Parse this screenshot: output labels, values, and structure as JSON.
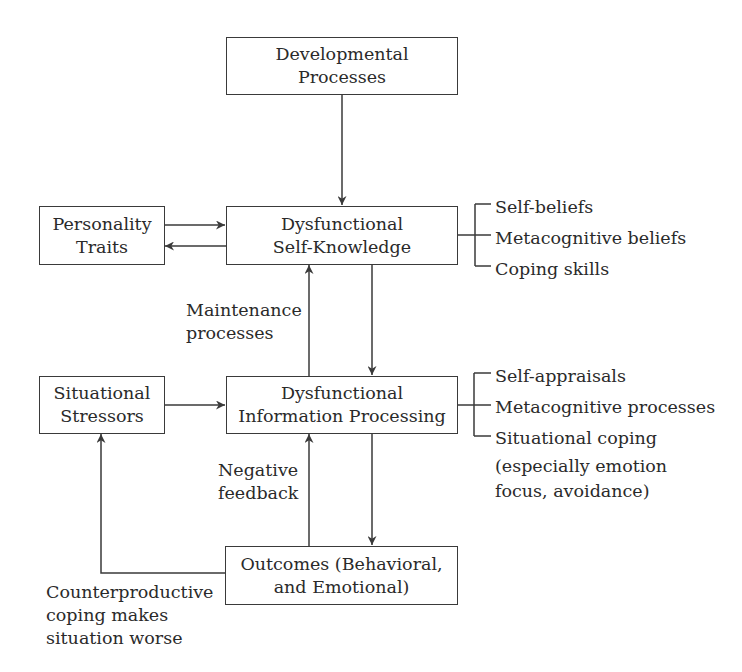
{
  "diagram": {
    "boxes": {
      "developmental": {
        "lines": [
          "Developmental",
          "Processes"
        ]
      },
      "personality": {
        "lines": [
          "Personality",
          "Traits"
        ]
      },
      "self_knowledge": {
        "lines": [
          "Dysfunctional",
          "Self-Knowledge"
        ]
      },
      "stressors": {
        "lines": [
          "Situational",
          "Stressors"
        ]
      },
      "info_processing": {
        "lines": [
          "Dysfunctional",
          "Information Processing"
        ]
      },
      "outcomes": {
        "lines": [
          "Outcomes (Behavioral,",
          "and Emotional)"
        ]
      }
    },
    "edge_labels": {
      "maintenance": {
        "lines": [
          "Maintenance",
          "processes"
        ]
      },
      "negative_feedback": {
        "lines": [
          "Negative",
          "feedback"
        ]
      },
      "counterproductive": {
        "lines": [
          "Counterproductive",
          "coping makes",
          "situation worse"
        ]
      }
    },
    "lists": {
      "self_knowledge_components": [
        "Self-beliefs",
        "Metacognitive beliefs",
        "Coping skills"
      ],
      "info_processing_components": [
        "Self-appraisals",
        "Metacognitive processes",
        "Situational coping",
        "(especially emotion",
        "focus, avoidance)"
      ]
    },
    "colors": {
      "line": "#3a3a3a",
      "text": "#2a2a2a",
      "background": "#ffffff"
    }
  }
}
